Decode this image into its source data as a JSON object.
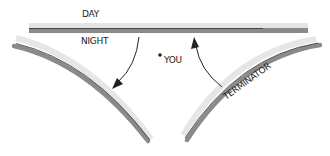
{
  "diagram": {
    "labels": {
      "day": "DAY",
      "night": "NIGHT",
      "you": "YOU",
      "terminator": "TERMINATOR"
    },
    "elements": [
      {
        "id": "horizon-line",
        "description": "horizontal day/night boundary band"
      },
      {
        "id": "left-curve",
        "description": "left terminator curve"
      },
      {
        "id": "right-curve",
        "description": "right terminator curve labeled TERMINATOR"
      },
      {
        "id": "arrow-down",
        "description": "arrow from horizontal band curving down toward left curve"
      },
      {
        "id": "arrow-up",
        "description": "arrow from right curve area pointing up to horizontal band"
      },
      {
        "id": "you-dot",
        "description": "dot marking observer position"
      }
    ],
    "colors": {
      "band_light": "#e6e6e6",
      "band_dark": "#8a8a8a",
      "ink": "#222222",
      "background": "#ffffff"
    }
  }
}
